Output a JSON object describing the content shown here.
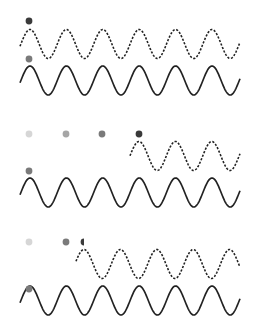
{
  "diagram": {
    "colors": {
      "wave": "#222222",
      "dot_darkest": "#3a3a3a",
      "dot_dark": "#7a7a7a",
      "dot_medium": "#a6a6a6",
      "dot_light": "#d6d6d6"
    },
    "wave_params": {
      "period": 36.4,
      "amplitude": 14.5,
      "x_end": 240
    },
    "panels": [
      {
        "name": "panel-1",
        "dashed_wave": {
          "x_start": 20,
          "center_y": 44,
          "peak_x": 30
        },
        "solid_wave": {
          "x_start": 20,
          "center_y": 80.5,
          "peak_x": 30
        },
        "dots": [
          {
            "x": 29,
            "y": 21,
            "shade": "dot_darkest",
            "half": false
          },
          {
            "x": 29,
            "y": 59,
            "shade": "dot_dark",
            "half": false
          }
        ]
      },
      {
        "name": "panel-2",
        "dashed_wave": {
          "x_start": 130,
          "center_y": 156,
          "peak_x": 139
        },
        "solid_wave": {
          "x_start": 20,
          "center_y": 192.5,
          "peak_x": 30
        },
        "dots": [
          {
            "x": 29,
            "y": 134,
            "shade": "dot_light",
            "half": false
          },
          {
            "x": 66,
            "y": 134,
            "shade": "dot_medium",
            "half": false
          },
          {
            "x": 102,
            "y": 134,
            "shade": "dot_dark",
            "half": false
          },
          {
            "x": 139,
            "y": 134,
            "shade": "dot_darkest",
            "half": false
          },
          {
            "x": 29,
            "y": 171,
            "shade": "dot_dark",
            "half": false
          }
        ]
      },
      {
        "name": "panel-3",
        "dashed_wave": {
          "x_start": 76,
          "center_y": 264,
          "peak_x": 84
        },
        "solid_wave": {
          "x_start": 20,
          "center_y": 300.5,
          "peak_x": 30
        },
        "dots": [
          {
            "x": 29,
            "y": 242,
            "shade": "dot_light",
            "half": false
          },
          {
            "x": 66,
            "y": 242,
            "shade": "dot_dark",
            "half": false
          },
          {
            "x": 84,
            "y": 242,
            "shade": "dot_darkest",
            "half": true
          },
          {
            "x": 29,
            "y": 289,
            "shade": "dot_dark",
            "half": false
          }
        ]
      }
    ]
  }
}
